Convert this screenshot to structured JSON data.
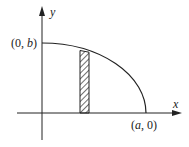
{
  "diagram": {
    "axes": {
      "x_label": "x",
      "y_label": "y"
    },
    "points": {
      "y_intercept": {
        "open": "(0, ",
        "var": "b",
        "close": ")"
      },
      "x_intercept": {
        "open": "(",
        "var": "a",
        "close": ", 0)"
      }
    },
    "curve": "quarter ellipse from (0, b) to (a, 0)",
    "strip": "hatched vertical rectangle element under the curve",
    "colors": {
      "line": "#222222",
      "background": "#ffffff"
    }
  }
}
